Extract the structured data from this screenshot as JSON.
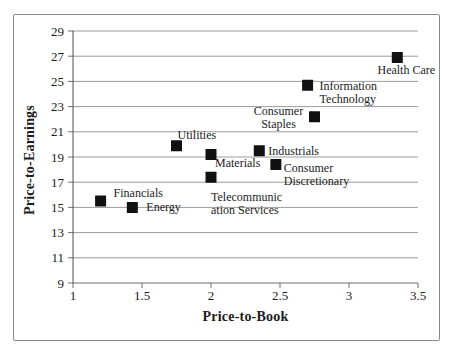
{
  "chart_data": {
    "type": "scatter",
    "title": "",
    "xlabel": "Price-to-Book",
    "ylabel": "Price-to-Earnings",
    "xlim": [
      1,
      3.5
    ],
    "ylim": [
      9,
      29
    ],
    "x_ticks": [
      "1",
      "1.5",
      "2",
      "2.5",
      "3",
      "3.5"
    ],
    "y_ticks": [
      "9",
      "11",
      "13",
      "15",
      "17",
      "19",
      "21",
      "23",
      "25",
      "27",
      "29"
    ],
    "grid": "horizontal-only",
    "legend": "none",
    "marker": {
      "shape": "square",
      "size": 11,
      "color": "#111111"
    },
    "colors": {
      "gridline": "#9c9c9c",
      "axis": "#6e6e6e",
      "text": "#1c1c1c",
      "frame_border": "#8a8a8a",
      "background": "#ffffff"
    },
    "points": [
      {
        "sector": "Financials",
        "x": 1.2,
        "y": 15.5,
        "label_lines": [
          "Financials"
        ],
        "anchor": "start",
        "dx": 13,
        "dy": -4
      },
      {
        "sector": "Energy",
        "x": 1.43,
        "y": 15.0,
        "label_lines": [
          "Energy"
        ],
        "anchor": "start",
        "dx": 14,
        "dy": 4
      },
      {
        "sector": "Utilities",
        "x": 1.75,
        "y": 19.9,
        "label_lines": [
          "Utilities"
        ],
        "anchor": "start",
        "dx": 1,
        "dy": -7
      },
      {
        "sector": "Materials",
        "x": 2.0,
        "y": 19.2,
        "label_lines": [
          "Materials"
        ],
        "anchor": "start",
        "dx": 4,
        "dy": 13
      },
      {
        "sector": "Telecommunication Services",
        "x": 2.0,
        "y": 17.4,
        "label_lines": [
          "Telecommunic",
          "ation Services"
        ],
        "anchor": "start",
        "dx": 0,
        "dy": 24
      },
      {
        "sector": "Industrials",
        "x": 2.35,
        "y": 19.5,
        "label_lines": [
          "Industrials"
        ],
        "anchor": "start",
        "dx": 9,
        "dy": 4
      },
      {
        "sector": "Consumer Discretionary",
        "x": 2.47,
        "y": 18.4,
        "label_lines": [
          "Consumer",
          "Discretionary"
        ],
        "anchor": "start",
        "dx": 8,
        "dy": 7
      },
      {
        "sector": "Consumer Staples",
        "x": 2.75,
        "y": 22.2,
        "label_lines": [
          "Consumer",
          "Staples"
        ],
        "anchor": "middle",
        "dx": -36,
        "dy": -2
      },
      {
        "sector": "Information Technology",
        "x": 2.7,
        "y": 24.7,
        "label_lines": [
          "Information",
          "Technology"
        ],
        "anchor": "start",
        "dx": 12,
        "dy": 5
      },
      {
        "sector": "Health Care",
        "x": 3.35,
        "y": 26.9,
        "label_lines": [
          "Health Care"
        ],
        "anchor": "middle",
        "dx": 9,
        "dy": 17
      }
    ]
  }
}
